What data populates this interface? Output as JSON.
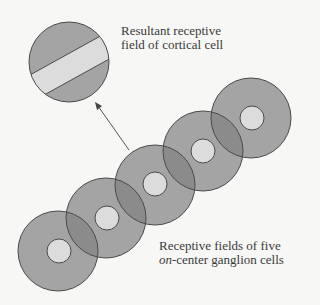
{
  "labels": {
    "cortical": {
      "line1": "Resultant receptive",
      "line2": "field of cortical cell"
    },
    "ganglion": {
      "line1": "Receptive fields of five",
      "line2_italic": "on",
      "line2_rest": "-center ganglion cells"
    }
  },
  "colors": {
    "background": "#f7f7f5",
    "surround": "#a4a4a4",
    "center": "#dcdcdc",
    "overlap": "#8b8b8b",
    "outline": "#4a4a4a"
  },
  "ganglion_cells": [
    {
      "cx": 58,
      "cy": 251,
      "r": 40,
      "center_r": 12
    },
    {
      "cx": 106,
      "cy": 218,
      "r": 40,
      "center_r": 12
    },
    {
      "cx": 155,
      "cy": 185,
      "r": 40,
      "center_r": 12
    },
    {
      "cx": 203,
      "cy": 151,
      "r": 40,
      "center_r": 12
    },
    {
      "cx": 251,
      "cy": 118,
      "r": 40,
      "center_r": 12
    }
  ],
  "cortical_cell": {
    "cx": 69,
    "cy": 62,
    "r": 40
  }
}
